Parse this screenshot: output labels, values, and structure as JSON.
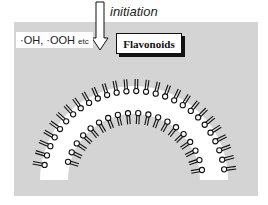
{
  "labels": {
    "initiation": "initiation",
    "radicals_main": "·OH, ·OOH",
    "radicals_suffix": "etc",
    "flavonoids": "Flavonoids"
  },
  "colors": {
    "background": "#d4d4d4",
    "ink": "#111111"
  }
}
